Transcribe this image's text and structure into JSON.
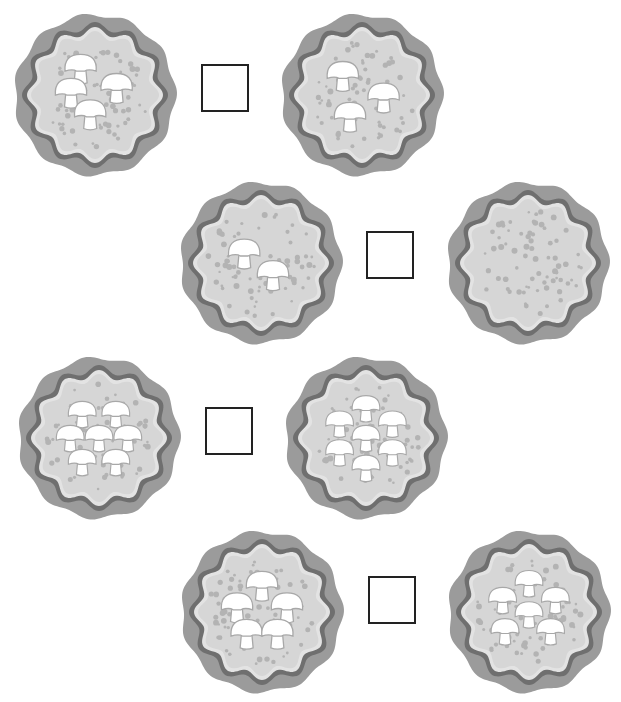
{
  "colors": {
    "crust": "#9b9b9b",
    "sauce": "#6f6f6f",
    "cheese_rim": "#e3e3e3",
    "cheese": "#d6d6d6",
    "dots": "#b3b3b3",
    "mushroom": "#ffffff",
    "mushroom_outline": "#a8a8a8",
    "box_border": "#222222"
  },
  "rows": [
    {
      "left": {
        "mushrooms": 4
      },
      "answer": "",
      "right": {
        "mushrooms": 3
      }
    },
    {
      "left": {
        "mushrooms": 2
      },
      "answer": "",
      "right": {
        "mushrooms": 0
      }
    },
    {
      "left": {
        "mushrooms": 7
      },
      "answer": "",
      "right": {
        "mushrooms": 7
      }
    },
    {
      "left": {
        "mushrooms": 5
      },
      "answer": "",
      "right": {
        "mushrooms": 6
      }
    }
  ]
}
